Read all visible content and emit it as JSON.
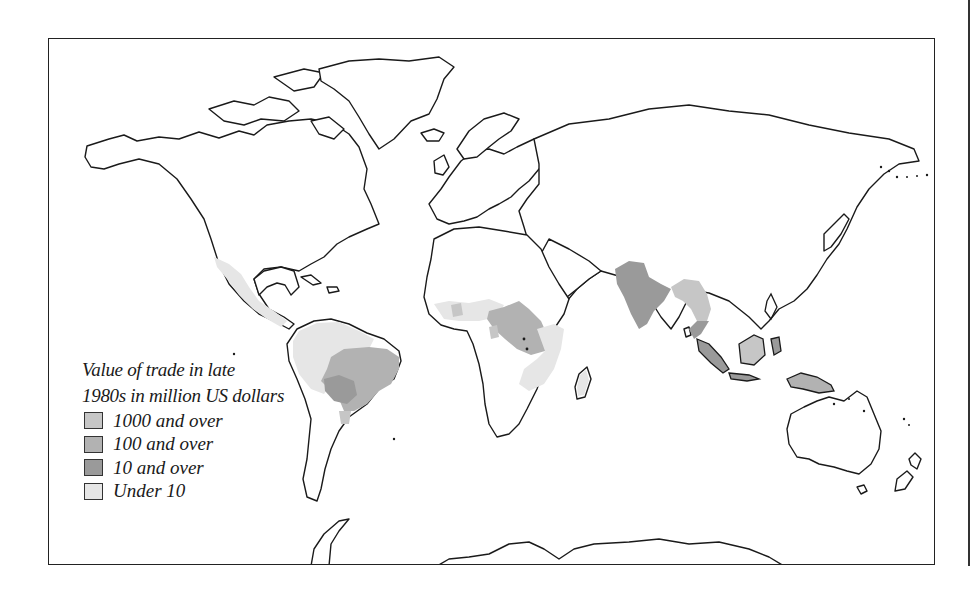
{
  "map": {
    "type": "choropleth world map",
    "legend": {
      "title_line1": "Value of trade in late",
      "title_line2": "1980s in million US dollars",
      "items": [
        {
          "label": "1000 and over",
          "color": "#c6c6c6"
        },
        {
          "label": "100 and over",
          "color": "#b2b2b2"
        },
        {
          "label": "10 and over",
          "color": "#9a9a9a"
        },
        {
          "label": "Under 10",
          "color": "#e6e6e6"
        }
      ]
    },
    "shaded_regions": [
      {
        "region": "Mexico / Central America",
        "category": "Under 10"
      },
      {
        "region": "Northern South America (Colombia, Venezuela, Guianas, Peru)",
        "category": "Under 10"
      },
      {
        "region": "Brazil",
        "category": "100 and over"
      },
      {
        "region": "Bolivia / western Amazon",
        "category": "10 and over"
      },
      {
        "region": "West Africa",
        "category": "Under 10"
      },
      {
        "region": "Central Africa (Zaire, Congo, Cameroon, Gabon)",
        "category": "100 and over"
      },
      {
        "region": "East / Southern-central Africa",
        "category": "Under 10"
      },
      {
        "region": "Madagascar",
        "category": "Under 10"
      },
      {
        "region": "India",
        "category": "10 and over"
      },
      {
        "region": "Burma / Thailand / Indochina",
        "category": "1000 and over"
      },
      {
        "region": "Malaysia / Sumatra",
        "category": "10 and over"
      },
      {
        "region": "Borneo",
        "category": "1000 and over"
      },
      {
        "region": "New Guinea",
        "category": "100 and over"
      }
    ]
  }
}
